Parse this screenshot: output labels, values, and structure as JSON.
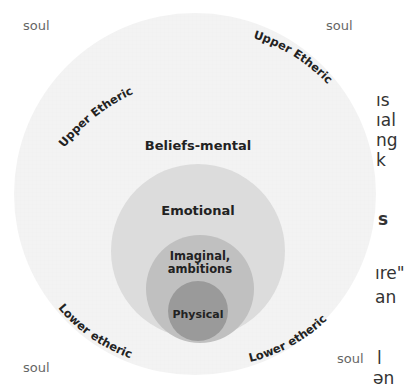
{
  "diagram": {
    "type": "nested-circles",
    "layers": [
      {
        "name": "Upper Etheric / Lower etheric (outer field)",
        "color": "#f1f1f1"
      },
      {
        "name": "Beliefs-mental",
        "color": "#f1f1f1"
      },
      {
        "name": "Emotional",
        "color": "#dcdcdc"
      },
      {
        "name": "Imaginal, ambitions",
        "color": "#c2c2c2"
      },
      {
        "name": "Physical",
        "color": "#9b9b9b"
      }
    ],
    "labels": {
      "beliefs": "Beliefs-mental",
      "emotional": "Emotional",
      "imaginal_line1": "Imaginal,",
      "imaginal_line2": "ambitions",
      "physical": "Physical",
      "upper_etheric_left": "Upper Etheric",
      "upper_etheric_right": "Upper Etheric",
      "lower_etheric_left": "Lower etheric",
      "lower_etheric_right": "Lower etheric"
    },
    "corner_labels": {
      "top_left": "soul",
      "top_right": "soul",
      "bottom_left": "soul",
      "bottom_right": "soul"
    }
  },
  "background_text": {
    "lines_top": [
      "ıs",
      "ıal",
      "ng",
      "k"
    ],
    "heading_fragment": "s",
    "lines_mid": [
      "ıre\"",
      "an"
    ],
    "lines_bottom": [
      "l",
      "ən"
    ]
  }
}
